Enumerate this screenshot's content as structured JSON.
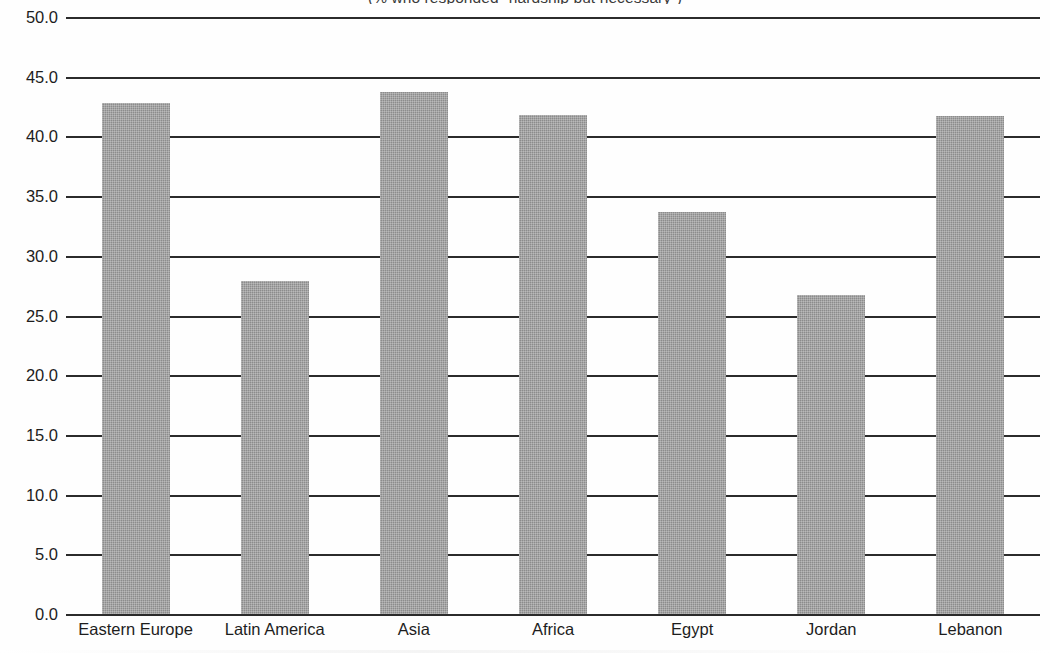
{
  "chart_data": {
    "type": "bar",
    "title": "",
    "subtitle": "(% who responded \"hardship but necessary\")",
    "xlabel": "",
    "ylabel": "",
    "categories": [
      "Eastern Europe",
      "Latin America",
      "Asia",
      "Africa",
      "Egypt",
      "Jordan",
      "Lebanon"
    ],
    "values": [
      42.8,
      27.9,
      43.7,
      41.8,
      33.7,
      26.7,
      41.7
    ],
    "ylim": [
      0.0,
      50.0
    ],
    "ytick_step": 5.0,
    "ytick_labels": [
      "0.0",
      "5.0",
      "10.0",
      "15.0",
      "20.0",
      "25.0",
      "30.0",
      "35.0",
      "40.0",
      "45.0",
      "50.0"
    ],
    "ytick_values": [
      0.0,
      5.0,
      10.0,
      15.0,
      20.0,
      25.0,
      30.0,
      35.0,
      40.0,
      45.0,
      50.0
    ],
    "grid": true,
    "grid_orientation": "horizontal",
    "legend": false,
    "legend_position": "none",
    "bar_color": "#8c8c8c",
    "grid_color": "#2b2b2b",
    "background_color": "#ffffff",
    "text_color": "#1d1d1d"
  }
}
